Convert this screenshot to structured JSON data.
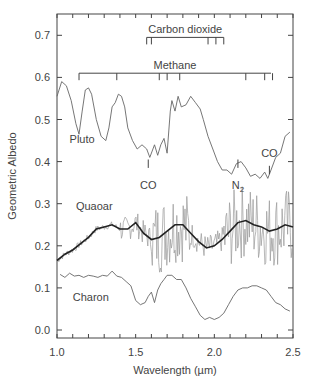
{
  "chart_data": {
    "type": "line",
    "title": "",
    "xlabel": "Wavelength (µm)",
    "ylabel": "Geometric Albedo",
    "xlim": [
      1.0,
      2.5
    ],
    "ylim": [
      -0.02,
      0.75
    ],
    "xticks": [
      1.0,
      1.5,
      2.0,
      2.5
    ],
    "xtick_labels": [
      "1.0",
      "1.5",
      "2.0",
      "2.5"
    ],
    "yticks": [
      0.0,
      0.1,
      0.2,
      0.3,
      0.4,
      0.5,
      0.6,
      0.7
    ],
    "ytick_labels": [
      "0.0",
      "0.1",
      "0.2",
      "0.3",
      "0.4",
      "0.5",
      "0.6",
      "0.7"
    ],
    "grid": false,
    "legend": "none (inline curve labels)",
    "series": [
      {
        "name": "Pluto",
        "color": "#666666",
        "x": [
          1.0,
          1.03,
          1.06,
          1.09,
          1.12,
          1.14,
          1.16,
          1.18,
          1.2,
          1.22,
          1.25,
          1.28,
          1.31,
          1.33,
          1.35,
          1.37,
          1.39,
          1.41,
          1.43,
          1.45,
          1.48,
          1.51,
          1.54,
          1.57,
          1.59,
          1.62,
          1.64,
          1.66,
          1.68,
          1.7,
          1.72,
          1.73,
          1.75,
          1.77,
          1.79,
          1.82,
          1.85,
          1.88,
          1.91,
          1.93,
          1.96,
          1.99,
          2.02,
          2.05,
          2.08,
          2.11,
          2.14,
          2.17,
          2.2,
          2.23,
          2.26,
          2.29,
          2.32,
          2.34,
          2.36,
          2.39,
          2.42,
          2.45,
          2.48
        ],
        "y": [
          0.555,
          0.59,
          0.58,
          0.545,
          0.49,
          0.465,
          0.52,
          0.57,
          0.575,
          0.56,
          0.5,
          0.46,
          0.45,
          0.48,
          0.53,
          0.54,
          0.56,
          0.555,
          0.53,
          0.48,
          0.45,
          0.43,
          0.44,
          0.43,
          0.41,
          0.44,
          0.415,
          0.44,
          0.455,
          0.42,
          0.52,
          0.545,
          0.52,
          0.555,
          0.53,
          0.535,
          0.555,
          0.54,
          0.525,
          0.5,
          0.46,
          0.43,
          0.4,
          0.38,
          0.38,
          0.37,
          0.395,
          0.4,
          0.385,
          0.365,
          0.37,
          0.36,
          0.375,
          0.36,
          0.38,
          0.41,
          0.42,
          0.46,
          0.47
        ]
      },
      {
        "name": "Quaoar",
        "color": "#222222",
        "noise_color": "#999999",
        "x": [
          1.0,
          1.05,
          1.1,
          1.15,
          1.2,
          1.25,
          1.3,
          1.35,
          1.4,
          1.45,
          1.5,
          1.55,
          1.6,
          1.65,
          1.7,
          1.75,
          1.8,
          1.85,
          1.9,
          1.95,
          2.0,
          2.05,
          2.1,
          2.15,
          2.2,
          2.25,
          2.3,
          2.35,
          2.4,
          2.45,
          2.5
        ],
        "y": [
          0.165,
          0.18,
          0.19,
          0.205,
          0.22,
          0.24,
          0.245,
          0.25,
          0.24,
          0.24,
          0.255,
          0.23,
          0.215,
          0.22,
          0.235,
          0.25,
          0.25,
          0.23,
          0.21,
          0.195,
          0.2,
          0.215,
          0.235,
          0.255,
          0.26,
          0.25,
          0.245,
          0.235,
          0.24,
          0.25,
          0.245
        ]
      },
      {
        "name": "Charon",
        "color": "#666666",
        "x": [
          1.02,
          1.05,
          1.08,
          1.11,
          1.14,
          1.17,
          1.2,
          1.23,
          1.26,
          1.29,
          1.32,
          1.35,
          1.38,
          1.41,
          1.44,
          1.47,
          1.5,
          1.53,
          1.56,
          1.58,
          1.6,
          1.62,
          1.64,
          1.66,
          1.68,
          1.7,
          1.73,
          1.76,
          1.79,
          1.82,
          1.85,
          1.88,
          1.91,
          1.94,
          1.97,
          2.0,
          2.03,
          2.06,
          2.09,
          2.12,
          2.15,
          2.18,
          2.21,
          2.24,
          2.27,
          2.3,
          2.33,
          2.36,
          2.39,
          2.42,
          2.45,
          2.48
        ],
        "y": [
          0.132,
          0.125,
          0.135,
          0.128,
          0.13,
          0.125,
          0.13,
          0.128,
          0.125,
          0.13,
          0.128,
          0.14,
          0.128,
          0.125,
          0.115,
          0.105,
          0.07,
          0.06,
          0.065,
          0.08,
          0.09,
          0.065,
          0.095,
          0.11,
          0.12,
          0.13,
          0.13,
          0.12,
          0.12,
          0.1,
          0.075,
          0.055,
          0.035,
          0.025,
          0.03,
          0.025,
          0.03,
          0.04,
          0.06,
          0.08,
          0.095,
          0.1,
          0.1,
          0.105,
          0.105,
          0.1,
          0.095,
          0.08,
          0.065,
          0.06,
          0.05,
          0.045
        ]
      }
    ],
    "annotations": {
      "curve_labels": [
        {
          "text": "Pluto",
          "x": 1.08,
          "y": 0.445
        },
        {
          "text": "Quaoar",
          "x": 1.12,
          "y": 0.285
        },
        {
          "text": "Charon",
          "x": 1.1,
          "y": 0.07
        }
      ],
      "absorption_bands": [
        {
          "label": "Carbon dioxide",
          "y": 0.695,
          "x_start": 1.57,
          "x_end": 2.06,
          "ticks": [
            1.57,
            1.6,
            1.96,
            2.01,
            2.06
          ]
        },
        {
          "label": "Methane",
          "y": 0.61,
          "x_start": 1.14,
          "x_end": 2.36,
          "ticks": [
            1.14,
            1.38,
            1.65,
            1.7,
            1.78,
            2.2,
            2.32,
            2.37
          ]
        }
      ],
      "line_markers": [
        {
          "label": "CO",
          "subscript": "",
          "x": 1.58,
          "y_top": 0.405,
          "y_bottom": 0.385,
          "label_y": 0.345
        },
        {
          "label": "N",
          "subscript": "2",
          "x": 2.15,
          "y_top": 0.405,
          "y_bottom": 0.385,
          "label_y": 0.345
        },
        {
          "label": "CO",
          "subscript": "",
          "x": 2.35,
          "y_top": 0.39,
          "y_bottom": 0.37,
          "label_y": 0.41
        }
      ]
    }
  }
}
